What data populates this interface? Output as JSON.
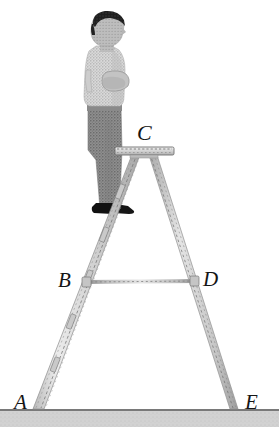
{
  "figure": {
    "width": 279,
    "height": 427,
    "background_color": "#ffffff"
  },
  "labels": {
    "A": "A",
    "B": "B",
    "C": "C",
    "D": "D",
    "E": "E"
  },
  "colors": {
    "background": "#ffffff",
    "ground_line": "#4d4d4d",
    "ground_fill": "#cfcfcf",
    "ladder_rail": "#d9d9d9",
    "ladder_rail_edge": "#8a8a8a",
    "ladder_hatch": "#6e6e6e",
    "platform_fill": "#e2e2e2",
    "platform_edge": "#777777",
    "crossbar": "#9c9c9c",
    "label_text": "#151515",
    "hair": "#1b1b1b",
    "skin": "#b9b9b9",
    "shirt": "#dcdcdc",
    "shirt_shade": "#bdbdbd",
    "trousers": "#8d8d8d",
    "shoes": "#111111"
  },
  "geometry": {
    "ground_y": 410,
    "apex": {
      "x": 144,
      "y": 150
    },
    "point_A": {
      "x": 36,
      "y": 410
    },
    "point_B": {
      "x": 84,
      "y": 282
    },
    "point_C": {
      "x": 144,
      "y": 152
    },
    "point_D": {
      "x": 196,
      "y": 282
    },
    "point_E": {
      "x": 233,
      "y": 410
    },
    "platform": {
      "x": 116,
      "y": 148,
      "width": 57,
      "height": 7
    },
    "crossbar": {
      "x1": 86,
      "y1": 282,
      "x2": 196,
      "y2": 281
    }
  },
  "person": {
    "description": "Man standing on the stepladder, arms folded, facing right",
    "head_top_y": 12,
    "feet_y": 212
  }
}
